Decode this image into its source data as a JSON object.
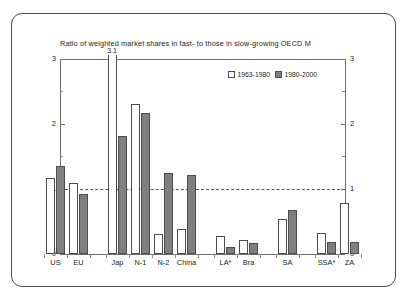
{
  "chart_data": {
    "type": "bar",
    "title": "Ratio of weighted market shares in fast- to those in slow-growing OECD M",
    "xlabel": "",
    "ylabel": "",
    "ylim": [
      0,
      3
    ],
    "yticks": [
      0,
      1,
      2,
      3
    ],
    "ytick_labels": [
      "0",
      "1",
      "2",
      "3"
    ],
    "minor_tick_step": 0.5,
    "grid": false,
    "reference_line": 1,
    "dual_axis": true,
    "legend_position": "top-right",
    "categories": [
      "US",
      "EU",
      "Jap",
      "N-1",
      "N-2",
      "China",
      "LA*",
      "Bra",
      "SA",
      "SSA*",
      "ZA"
    ],
    "series": [
      {
        "name": "1963-1980",
        "color": "#ffffff",
        "values": [
          1.17,
          1.1,
          3.1,
          2.31,
          0.31,
          0.39,
          0.27,
          0.21,
          0.54,
          0.33,
          0.79
        ]
      },
      {
        "name": "1980-2000",
        "color": "#808080",
        "values": [
          1.35,
          0.93,
          1.81,
          2.17,
          1.25,
          1.21,
          0.11,
          0.17,
          0.68,
          0.19,
          0.18
        ]
      }
    ],
    "annotations": [
      {
        "text": "3.1",
        "category": "Jap",
        "series": "1963-1980",
        "note": "bar clipped at axis top"
      }
    ],
    "group_gaps_after": [
      "EU",
      "China",
      "Bra",
      "SA"
    ]
  },
  "legend": {
    "entries": [
      {
        "label": "1963-1980",
        "style": "light"
      },
      {
        "label": "1980-2000",
        "style": "dark"
      }
    ]
  },
  "colors": {
    "bar_light": "#ffffff",
    "bar_dark": "#808080",
    "bar_edge": "#4d4d4d",
    "axis": "#6e6e6e",
    "frame": "#4a4a4a",
    "text": "#232323",
    "background": "#ffffff"
  }
}
